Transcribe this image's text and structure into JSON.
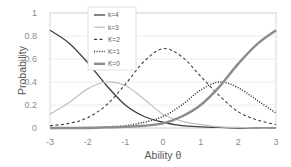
{
  "chart_data": {
    "type": "line",
    "title": "",
    "xlabel": "Ability θ",
    "ylabel": "Probability",
    "xlim": [
      -3,
      3
    ],
    "ylim": [
      0,
      1
    ],
    "grid": true,
    "legend_position": "upper-left-inside",
    "x_ticks": [
      "-3",
      "-2",
      "-1",
      "0",
      "1",
      "2",
      "3"
    ],
    "y_ticks": [
      "0",
      "0.2",
      "0.4",
      "0.6",
      "0.8",
      "1"
    ],
    "x": [
      -3,
      -2.5,
      -2,
      -1.5,
      -1,
      -0.5,
      0,
      0.5,
      1,
      1.5,
      2,
      2.5,
      3
    ],
    "series": [
      {
        "name": "k=4",
        "style": "solid-dark",
        "values": [
          0.85,
          0.74,
          0.57,
          0.37,
          0.2,
          0.1,
          0.05,
          0.02,
          0.01,
          0.005,
          0.0,
          0.0,
          0.0
        ]
      },
      {
        "name": "k=3",
        "style": "solid-light",
        "values": [
          0.12,
          0.22,
          0.34,
          0.4,
          0.37,
          0.25,
          0.12,
          0.06,
          0.03,
          0.01,
          0.005,
          0.0,
          0.0
        ]
      },
      {
        "name": "K=2",
        "style": "dashed",
        "values": [
          0.02,
          0.04,
          0.09,
          0.2,
          0.38,
          0.58,
          0.69,
          0.62,
          0.45,
          0.28,
          0.14,
          0.07,
          0.03
        ]
      },
      {
        "name": "K=1",
        "style": "dotted",
        "values": [
          0.0,
          0.0,
          0.005,
          0.01,
          0.02,
          0.05,
          0.1,
          0.2,
          0.33,
          0.4,
          0.35,
          0.24,
          0.13
        ]
      },
      {
        "name": "K=0",
        "style": "thick-gray",
        "values": [
          0.0,
          0.0,
          0.0,
          0.005,
          0.01,
          0.02,
          0.04,
          0.1,
          0.2,
          0.36,
          0.56,
          0.73,
          0.85
        ]
      }
    ]
  }
}
